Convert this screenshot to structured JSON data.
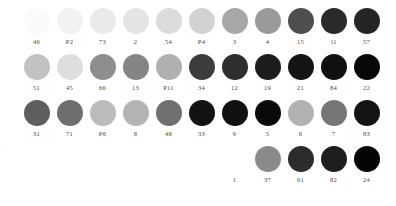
{
  "figure": {
    "type": "color-swatch-grid",
    "background": "#ffffff",
    "label_color": "#4a4a4a",
    "edge_mark": "·"
  },
  "chart_data": {
    "type": "table",
    "title": "",
    "subtitle": "",
    "xlabel": "",
    "ylabel": "",
    "legend": [],
    "grid": false,
    "rows": [
      {
        "row": 1,
        "leading_blank_cells": 1,
        "items": [
          {
            "label": "46",
            "color": "#fafafa"
          },
          {
            "label": "P2",
            "color": "#f2f2f2"
          },
          {
            "label": "73",
            "color": "#eaeaea"
          },
          {
            "label": "2",
            "color": "#e4e4e4"
          },
          {
            "label": "54",
            "color": "#dcdcdc"
          },
          {
            "label": "P4",
            "color": "#d2d2d2"
          },
          {
            "label": "3",
            "color": "#a8a8a8"
          },
          {
            "label": "4",
            "color": "#9a9a9a"
          },
          {
            "label": "15",
            "color": "#4e4e4e"
          },
          {
            "label": "11",
            "color": "#2a2a2a"
          },
          {
            "label": "57",
            "color": "#252525"
          }
        ]
      },
      {
        "row": 2,
        "leading_blank_cells": 1,
        "items": [
          {
            "label": "51",
            "color": "#c2c2c2"
          },
          {
            "label": "45",
            "color": "#dedede"
          },
          {
            "label": "66",
            "color": "#8e8e8e"
          },
          {
            "label": "13",
            "color": "#848484"
          },
          {
            "label": "P11",
            "color": "#b0b0b0"
          },
          {
            "label": "34",
            "color": "#3c3c3c"
          },
          {
            "label": "12",
            "color": "#2e2e2e"
          },
          {
            "label": "19",
            "color": "#1c1c1c"
          },
          {
            "label": "21",
            "color": "#151515"
          },
          {
            "label": "84",
            "color": "#101010"
          },
          {
            "label": "22",
            "color": "#080808"
          }
        ]
      },
      {
        "row": 3,
        "leading_blank_cells": 1,
        "items": [
          {
            "label": "31",
            "color": "#5e5e5e"
          },
          {
            "label": "71",
            "color": "#6e6e6e"
          },
          {
            "label": "P6",
            "color": "#bcbcbc"
          },
          {
            "label": "8",
            "color": "#b4b4b4"
          },
          {
            "label": "48",
            "color": "#707070"
          },
          {
            "label": "33",
            "color": "#121212"
          },
          {
            "label": "9",
            "color": "#101010"
          },
          {
            "label": "5",
            "color": "#0a0a0a"
          },
          {
            "label": "6",
            "color": "#b2b2b2"
          },
          {
            "label": "7",
            "color": "#767676"
          },
          {
            "label": "83",
            "color": "#141414"
          }
        ]
      },
      {
        "row": 4,
        "leading_blank_cells": 7,
        "items": [
          {
            "label": "1",
            "color": "#ffffff"
          },
          {
            "label": "37",
            "color": "#8a8a8a"
          },
          {
            "label": "61",
            "color": "#2c2c2c"
          },
          {
            "label": "82",
            "color": "#1e1e1e"
          },
          {
            "label": "24",
            "color": "#050505"
          }
        ]
      }
    ]
  }
}
